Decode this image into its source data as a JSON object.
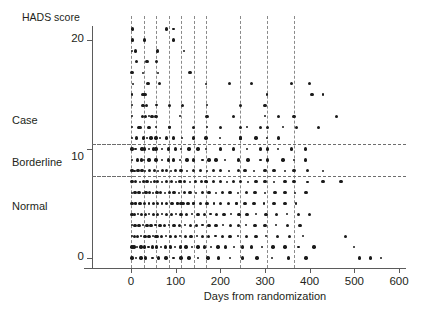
{
  "chart_data": {
    "type": "scatter",
    "title": "",
    "xlabel": "Days from randomization",
    "ylabel": "HADS score",
    "xlim": [
      -20,
      620
    ],
    "ylim": [
      -0.6,
      22.5
    ],
    "xticks": [
      0,
      100,
      200,
      300,
      400,
      500,
      600
    ],
    "xticklabels": [
      "0",
      "100",
      "200",
      "300",
      "400",
      "500",
      "600"
    ],
    "yticks": [
      0,
      10,
      20
    ],
    "yticklabels": [
      "0",
      "10",
      "20"
    ],
    "grid": "dashed-reference-lines",
    "legend": "none",
    "category_bands": [
      {
        "label": "Normal",
        "range": [
          0,
          7
        ],
        "label_y": 4.2
      },
      {
        "label": "Borderline",
        "range": [
          8,
          10
        ],
        "label_y": 9.2
      },
      {
        "label": "Case",
        "range": [
          11,
          21
        ],
        "label_y": 13.8
      }
    ],
    "hlines": [
      10.5,
      7.5
    ],
    "vlines": [
      0,
      28,
      56,
      84,
      112,
      140,
      168,
      245,
      305,
      365
    ],
    "marker": {
      "shape": "circle",
      "color": "#1a1a1a",
      "size_small": 2.2,
      "size_large": 3.4
    },
    "points": [
      [
        3,
        21
      ],
      [
        3,
        20
      ],
      [
        2,
        19
      ],
      [
        10,
        19
      ],
      [
        80,
        21
      ],
      [
        95,
        21
      ],
      [
        30,
        20
      ],
      [
        2,
        17
      ],
      [
        26,
        17
      ],
      [
        57,
        18
      ],
      [
        38,
        16
      ],
      [
        168,
        16
      ],
      [
        220,
        16
      ],
      [
        270,
        16
      ],
      [
        305,
        15
      ],
      [
        360,
        16
      ],
      [
        400,
        16
      ],
      [
        2,
        15
      ],
      [
        27,
        15
      ],
      [
        31,
        15
      ],
      [
        2,
        14
      ],
      [
        27,
        14
      ],
      [
        35,
        14
      ],
      [
        57,
        14
      ],
      [
        86,
        14
      ],
      [
        115,
        14
      ],
      [
        170,
        14
      ],
      [
        245,
        14
      ],
      [
        300,
        14
      ],
      [
        2,
        13
      ],
      [
        26,
        13
      ],
      [
        33,
        13
      ],
      [
        40,
        13
      ],
      [
        47,
        13
      ],
      [
        56,
        13
      ],
      [
        110,
        13
      ],
      [
        170,
        13
      ],
      [
        230,
        13
      ],
      [
        300,
        13
      ],
      [
        330,
        13
      ],
      [
        365,
        13
      ],
      [
        2,
        12
      ],
      [
        18,
        12
      ],
      [
        40,
        12
      ],
      [
        56,
        12
      ],
      [
        86,
        12
      ],
      [
        140,
        12
      ],
      [
        170,
        12
      ],
      [
        200,
        12
      ],
      [
        245,
        12
      ],
      [
        260,
        12
      ],
      [
        290,
        12
      ],
      [
        305,
        12
      ],
      [
        340,
        12
      ],
      [
        370,
        12
      ],
      [
        420,
        12
      ],
      [
        2,
        11
      ],
      [
        12,
        11
      ],
      [
        28,
        11
      ],
      [
        35,
        11
      ],
      [
        45,
        11
      ],
      [
        56,
        11
      ],
      [
        65,
        11
      ],
      [
        80,
        11
      ],
      [
        95,
        11
      ],
      [
        115,
        11
      ],
      [
        140,
        11
      ],
      [
        168,
        11
      ],
      [
        200,
        11
      ],
      [
        245,
        11
      ],
      [
        280,
        11
      ],
      [
        305,
        11
      ],
      [
        330,
        11
      ],
      [
        2,
        10
      ],
      [
        10,
        10
      ],
      [
        25,
        10
      ],
      [
        30,
        10
      ],
      [
        40,
        10
      ],
      [
        50,
        10
      ],
      [
        56,
        10
      ],
      [
        70,
        10
      ],
      [
        84,
        10
      ],
      [
        100,
        10
      ],
      [
        112,
        10
      ],
      [
        130,
        10
      ],
      [
        150,
        10
      ],
      [
        168,
        10
      ],
      [
        200,
        10
      ],
      [
        230,
        10
      ],
      [
        260,
        10
      ],
      [
        290,
        10
      ],
      [
        305,
        10
      ],
      [
        330,
        10
      ],
      [
        360,
        10
      ],
      [
        390,
        10
      ],
      [
        2,
        9
      ],
      [
        14,
        9
      ],
      [
        24,
        9
      ],
      [
        30,
        9
      ],
      [
        40,
        9
      ],
      [
        56,
        9
      ],
      [
        70,
        9
      ],
      [
        84,
        9
      ],
      [
        95,
        9
      ],
      [
        110,
        9
      ],
      [
        125,
        9
      ],
      [
        140,
        9
      ],
      [
        160,
        9
      ],
      [
        175,
        9
      ],
      [
        190,
        9
      ],
      [
        210,
        9
      ],
      [
        240,
        9
      ],
      [
        262,
        9
      ],
      [
        290,
        9
      ],
      [
        305,
        9
      ],
      [
        340,
        9
      ],
      [
        365,
        9
      ],
      [
        390,
        9
      ],
      [
        2,
        8
      ],
      [
        8,
        8
      ],
      [
        16,
        8
      ],
      [
        25,
        8
      ],
      [
        32,
        8
      ],
      [
        42,
        8
      ],
      [
        52,
        8
      ],
      [
        60,
        8
      ],
      [
        70,
        8
      ],
      [
        80,
        8
      ],
      [
        90,
        8
      ],
      [
        100,
        8
      ],
      [
        112,
        8
      ],
      [
        125,
        8
      ],
      [
        140,
        8
      ],
      [
        155,
        8
      ],
      [
        170,
        8
      ],
      [
        185,
        8
      ],
      [
        200,
        8
      ],
      [
        220,
        8
      ],
      [
        240,
        8
      ],
      [
        255,
        8
      ],
      [
        275,
        8
      ],
      [
        300,
        8
      ],
      [
        320,
        8
      ],
      [
        345,
        8
      ],
      [
        365,
        8
      ],
      [
        395,
        8
      ],
      [
        430,
        8
      ],
      [
        2,
        7
      ],
      [
        10,
        7
      ],
      [
        20,
        7
      ],
      [
        28,
        7
      ],
      [
        36,
        7
      ],
      [
        44,
        7
      ],
      [
        52,
        7
      ],
      [
        60,
        7
      ],
      [
        70,
        7
      ],
      [
        80,
        7
      ],
      [
        90,
        7
      ],
      [
        100,
        7
      ],
      [
        110,
        7
      ],
      [
        120,
        7
      ],
      [
        132,
        7
      ],
      [
        145,
        7
      ],
      [
        158,
        7
      ],
      [
        170,
        7
      ],
      [
        185,
        7
      ],
      [
        200,
        7
      ],
      [
        215,
        7
      ],
      [
        230,
        7
      ],
      [
        245,
        7
      ],
      [
        262,
        7
      ],
      [
        280,
        7
      ],
      [
        300,
        7
      ],
      [
        320,
        7
      ],
      [
        345,
        7
      ],
      [
        365,
        7
      ],
      [
        395,
        7
      ],
      [
        430,
        7
      ],
      [
        470,
        7
      ],
      [
        2,
        6
      ],
      [
        9,
        6
      ],
      [
        18,
        6
      ],
      [
        26,
        6
      ],
      [
        34,
        6
      ],
      [
        42,
        6
      ],
      [
        50,
        6
      ],
      [
        58,
        6
      ],
      [
        66,
        6
      ],
      [
        76,
        6
      ],
      [
        86,
        6
      ],
      [
        96,
        6
      ],
      [
        108,
        6
      ],
      [
        120,
        6
      ],
      [
        132,
        6
      ],
      [
        146,
        6
      ],
      [
        160,
        6
      ],
      [
        175,
        6
      ],
      [
        190,
        6
      ],
      [
        205,
        6
      ],
      [
        222,
        6
      ],
      [
        240,
        6
      ],
      [
        258,
        6
      ],
      [
        278,
        6
      ],
      [
        300,
        6
      ],
      [
        322,
        6
      ],
      [
        345,
        6
      ],
      [
        368,
        6
      ],
      [
        392,
        6
      ],
      [
        2,
        5
      ],
      [
        10,
        5
      ],
      [
        20,
        5
      ],
      [
        30,
        5
      ],
      [
        40,
        5
      ],
      [
        50,
        5
      ],
      [
        60,
        5
      ],
      [
        70,
        5
      ],
      [
        80,
        5
      ],
      [
        92,
        5
      ],
      [
        104,
        5
      ],
      [
        116,
        5
      ],
      [
        128,
        5
      ],
      [
        140,
        5
      ],
      [
        155,
        5
      ],
      [
        170,
        5
      ],
      [
        185,
        5
      ],
      [
        200,
        5
      ],
      [
        218,
        5
      ],
      [
        236,
        5
      ],
      [
        255,
        5
      ],
      [
        275,
        5
      ],
      [
        298,
        5
      ],
      [
        320,
        5
      ],
      [
        345,
        5
      ],
      [
        370,
        5
      ],
      [
        2,
        4
      ],
      [
        8,
        4
      ],
      [
        16,
        4
      ],
      [
        24,
        4
      ],
      [
        32,
        4
      ],
      [
        41,
        4
      ],
      [
        50,
        4
      ],
      [
        60,
        4
      ],
      [
        70,
        4
      ],
      [
        80,
        4
      ],
      [
        90,
        4
      ],
      [
        100,
        4
      ],
      [
        112,
        4
      ],
      [
        124,
        4
      ],
      [
        136,
        4
      ],
      [
        150,
        4
      ],
      [
        164,
        4
      ],
      [
        178,
        4
      ],
      [
        192,
        4
      ],
      [
        208,
        4
      ],
      [
        224,
        4
      ],
      [
        242,
        4
      ],
      [
        260,
        4
      ],
      [
        280,
        4
      ],
      [
        302,
        4
      ],
      [
        326,
        4
      ],
      [
        350,
        4
      ],
      [
        375,
        4
      ],
      [
        400,
        4
      ],
      [
        2,
        3
      ],
      [
        9,
        3
      ],
      [
        18,
        3
      ],
      [
        27,
        3
      ],
      [
        36,
        3
      ],
      [
        45,
        3
      ],
      [
        55,
        3
      ],
      [
        65,
        3
      ],
      [
        75,
        3
      ],
      [
        85,
        3
      ],
      [
        96,
        3
      ],
      [
        108,
        3
      ],
      [
        120,
        3
      ],
      [
        133,
        3
      ],
      [
        146,
        3
      ],
      [
        160,
        3
      ],
      [
        175,
        3
      ],
      [
        190,
        3
      ],
      [
        206,
        3
      ],
      [
        223,
        3
      ],
      [
        240,
        3
      ],
      [
        258,
        3
      ],
      [
        278,
        3
      ],
      [
        300,
        3
      ],
      [
        324,
        3
      ],
      [
        350,
        3
      ],
      [
        378,
        3
      ],
      [
        2,
        2
      ],
      [
        8,
        2
      ],
      [
        15,
        2
      ],
      [
        23,
        2
      ],
      [
        31,
        2
      ],
      [
        40,
        2
      ],
      [
        49,
        2
      ],
      [
        58,
        2
      ],
      [
        68,
        2
      ],
      [
        78,
        2
      ],
      [
        88,
        2
      ],
      [
        99,
        2
      ],
      [
        110,
        2
      ],
      [
        122,
        2
      ],
      [
        134,
        2
      ],
      [
        147,
        2
      ],
      [
        160,
        2
      ],
      [
        174,
        2
      ],
      [
        189,
        2
      ],
      [
        205,
        2
      ],
      [
        222,
        2
      ],
      [
        240,
        2
      ],
      [
        259,
        2
      ],
      [
        280,
        2
      ],
      [
        303,
        2
      ],
      [
        328,
        2
      ],
      [
        355,
        2
      ],
      [
        385,
        2
      ],
      [
        2,
        1
      ],
      [
        7,
        1
      ],
      [
        14,
        1
      ],
      [
        22,
        1
      ],
      [
        30,
        1
      ],
      [
        39,
        1
      ],
      [
        48,
        1
      ],
      [
        57,
        1
      ],
      [
        67,
        1
      ],
      [
        77,
        1
      ],
      [
        88,
        1
      ],
      [
        99,
        1
      ],
      [
        111,
        1
      ],
      [
        123,
        1
      ],
      [
        136,
        1
      ],
      [
        150,
        1
      ],
      [
        164,
        1
      ],
      [
        179,
        1
      ],
      [
        195,
        1
      ],
      [
        212,
        1
      ],
      [
        230,
        1
      ],
      [
        249,
        1
      ],
      [
        270,
        1
      ],
      [
        293,
        1
      ],
      [
        318,
        1
      ],
      [
        345,
        1
      ],
      [
        375,
        1
      ],
      [
        410,
        1
      ],
      [
        2,
        0
      ],
      [
        12,
        0
      ],
      [
        22,
        0
      ],
      [
        32,
        0
      ],
      [
        48,
        0
      ],
      [
        62,
        0
      ],
      [
        78,
        0
      ],
      [
        95,
        0
      ],
      [
        112,
        0
      ],
      [
        130,
        0
      ],
      [
        150,
        0
      ],
      [
        172,
        0
      ],
      [
        196,
        0
      ],
      [
        222,
        0
      ],
      [
        250,
        0
      ],
      [
        282,
        0
      ],
      [
        316,
        0
      ],
      [
        352,
        0
      ],
      [
        392,
        0
      ],
      [
        500,
        1
      ],
      [
        512,
        0
      ],
      [
        536,
        0
      ],
      [
        560,
        0
      ],
      [
        480,
        2
      ],
      [
        405,
        15
      ],
      [
        430,
        15
      ],
      [
        460,
        13
      ],
      [
        95,
        20
      ],
      [
        118,
        19
      ],
      [
        60,
        19
      ],
      [
        36,
        18
      ],
      [
        60,
        17
      ],
      [
        132,
        17
      ],
      [
        12,
        18
      ],
      [
        5,
        16
      ],
      [
        64,
        16
      ],
      [
        20,
        12
      ],
      [
        305,
        9
      ],
      [
        245,
        11
      ],
      [
        168,
        7
      ],
      [
        86,
        12
      ],
      [
        112,
        5
      ],
      [
        56,
        2
      ]
    ]
  },
  "geometry": {
    "plot_left": 131,
    "plot_right": 399,
    "axis_y_x": 92,
    "axis_x_y": 268,
    "y0_py": 258,
    "y20_py": 40
  }
}
